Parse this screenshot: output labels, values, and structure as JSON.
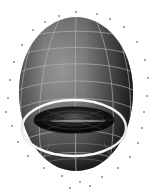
{
  "figure": {
    "title": "",
    "background_color": "#ffffff",
    "width": 158,
    "height": 192,
    "description": "Grayscale 3D shaded surface rendering of an egg-shaped (teardrop) body with a concave crater cavity on its lower face, overlaid with a light-gray parametric mesh grid, a bright white equatorial ring, and scattered small point markers around the silhouette"
  },
  "chart_data": {
    "type": "scatter",
    "title": "",
    "subtitle": "",
    "xlabel": "",
    "ylabel": "",
    "zlabel": "",
    "grid": true,
    "legend_position": "none",
    "axes_visible": false,
    "tick_labels": [],
    "annotations": [],
    "surface": {
      "name": "egg-shaped body with basal crater",
      "shading": "interp",
      "colormap": "gray",
      "body_fill_light": "#8d8d8d",
      "body_fill_mid": "#6c6c6c",
      "body_fill_dark": "#2a2a2a",
      "crater_fill_dark": "#0d0d0d",
      "mesh_line_color": "#b9b9b9",
      "highlight_ring_color": "#f2f2f2",
      "silhouette": {
        "left_px": 19,
        "right_px": 133,
        "top_px": 17,
        "bottom_px": 171,
        "center_x_px": 76,
        "center_y_px": 96
      },
      "equator_ring": {
        "center_x_px": 74,
        "center_y_px": 128,
        "radius_x_px": 52,
        "radius_y_px": 28
      },
      "crater": {
        "center_x_px": 74,
        "center_y_px": 120,
        "radius_x_px": 40,
        "radius_y_px": 13
      },
      "latitude_count": 7,
      "meridian_count": 5
    },
    "point_markers": {
      "name": "scattered point cloud",
      "marker": "dot",
      "color": "#3a3a3a",
      "size_px": 1.6,
      "count": 30,
      "points_px": [
        [
          76,
          12
        ],
        [
          97,
          14
        ],
        [
          59,
          16
        ],
        [
          110,
          19
        ],
        [
          45,
          22
        ],
        [
          33,
          30
        ],
        [
          124,
          27
        ],
        [
          137,
          42
        ],
        [
          22,
          45
        ],
        [
          14,
          62
        ],
        [
          145,
          60
        ],
        [
          148,
          78
        ],
        [
          10,
          80
        ],
        [
          8,
          98
        ],
        [
          147,
          96
        ],
        [
          144,
          112
        ],
        [
          6,
          112
        ],
        [
          12,
          126
        ],
        [
          142,
          128
        ],
        [
          18,
          142
        ],
        [
          138,
          143
        ],
        [
          28,
          156
        ],
        [
          130,
          157
        ],
        [
          44,
          168
        ],
        [
          118,
          168
        ],
        [
          62,
          176
        ],
        [
          102,
          177
        ],
        [
          80,
          182
        ],
        [
          90,
          186
        ],
        [
          70,
          188
        ]
      ]
    }
  }
}
